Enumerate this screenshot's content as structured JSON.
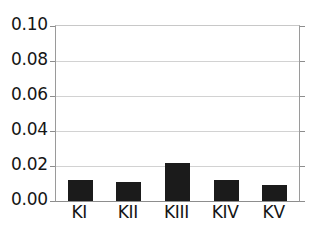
{
  "chart_data": {
    "type": "bar",
    "title": "",
    "subtitle": "",
    "xlabel": "",
    "ylabel": "",
    "categories": [
      "KI",
      "KII",
      "KIII",
      "KIV",
      "KV"
    ],
    "values": [
      0.012,
      0.011,
      0.022,
      0.012,
      0.009
    ],
    "series": [
      {
        "name": "",
        "values": [
          0.012,
          0.011,
          0.022,
          0.012,
          0.009
        ]
      }
    ],
    "ylim": [
      0.0,
      0.1
    ],
    "ytick_values": [
      0.1,
      0.08,
      0.06,
      0.04,
      0.02,
      0.0
    ],
    "ytick_labels": [
      "0.10",
      "0.08",
      "0.06",
      "0.04",
      "0.02",
      "0.00"
    ],
    "xtick_labels": [
      "KI",
      "KII",
      "KIII",
      "KIV",
      "KV"
    ],
    "grid": true,
    "grid_axis": "y",
    "legend": false,
    "legend_position": "none",
    "annotations": [],
    "bar_color": "#1b1b1b",
    "grid_color": "#d2d2d2",
    "axis_color": "#8d8d8d",
    "background_color": "#ffffff"
  }
}
